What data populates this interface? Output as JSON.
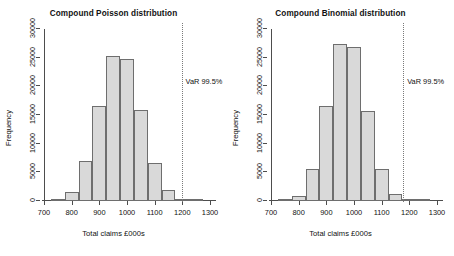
{
  "figure": {
    "width": 454,
    "height": 256,
    "background": "#ffffff",
    "bar_fill": "#d9d9d9",
    "bar_border": "#6e6e6e",
    "axis_color": "#4d4d4d",
    "var_line_color": "#7a7a7a"
  },
  "chart_data": [
    {
      "type": "bar",
      "title": "Compound Poisson distribution",
      "xlabel": "Total claims £000s",
      "ylabel": "Frequency",
      "xlim": [
        700,
        1300
      ],
      "ylim": [
        0,
        30000
      ],
      "xticks": [
        700,
        800,
        900,
        1000,
        1100,
        1200,
        1300
      ],
      "xticklabels": [
        "700",
        "800",
        "900",
        "1000",
        "1100",
        "1200",
        "1300"
      ],
      "yticks": [
        0,
        5000,
        10000,
        15000,
        20000,
        25000,
        30000
      ],
      "yticklabels": [
        "0",
        "5000",
        "10000",
        "15000",
        "20000",
        "25000",
        "30000"
      ],
      "grid": false,
      "legend": null,
      "bin_width": 50,
      "bin_starts": [
        725,
        775,
        825,
        875,
        925,
        975,
        1025,
        1075,
        1125,
        1175,
        1225
      ],
      "categories": [
        "725-775",
        "775-825",
        "825-875",
        "875-925",
        "925-975",
        "975-1025",
        "1025-1075",
        "1075-1125",
        "1125-1175",
        "1175-1225",
        "1225-1275"
      ],
      "values": [
        200,
        1600,
        7000,
        16600,
        25300,
        24700,
        15800,
        6700,
        1900,
        350,
        100
      ],
      "annotations": [
        {
          "name": "var-marker",
          "label": "VaR 99.5%",
          "x": 1197,
          "style": "dotted vertical line"
        }
      ]
    },
    {
      "type": "bar",
      "title": "Compound Binomial distribution",
      "xlabel": "Total claims £000s",
      "ylabel": "Frequency",
      "xlim": [
        700,
        1300
      ],
      "ylim": [
        0,
        30000
      ],
      "xticks": [
        700,
        800,
        900,
        1000,
        1100,
        1200,
        1300
      ],
      "xticklabels": [
        "700",
        "800",
        "900",
        "1000",
        "1100",
        "1200",
        "1300"
      ],
      "yticks": [
        0,
        5000,
        10000,
        15000,
        20000,
        25000,
        30000
      ],
      "yticklabels": [
        "0",
        "5000",
        "10000",
        "15000",
        "20000",
        "25000",
        "30000"
      ],
      "grid": false,
      "legend": null,
      "bin_width": 50,
      "bin_starts": [
        725,
        775,
        825,
        875,
        925,
        975,
        1025,
        1075,
        1125,
        1175,
        1225
      ],
      "categories": [
        "725-775",
        "775-825",
        "825-875",
        "875-925",
        "925-975",
        "975-1025",
        "1025-1075",
        "1075-1125",
        "1125-1175",
        "1175-1225",
        "1225-1275"
      ],
      "values": [
        150,
        900,
        5500,
        16500,
        27400,
        26800,
        15700,
        5600,
        1200,
        250,
        80
      ],
      "annotations": [
        {
          "name": "var-marker",
          "label": "VaR 99.5%",
          "x": 1178,
          "style": "dotted vertical line"
        }
      ]
    }
  ]
}
